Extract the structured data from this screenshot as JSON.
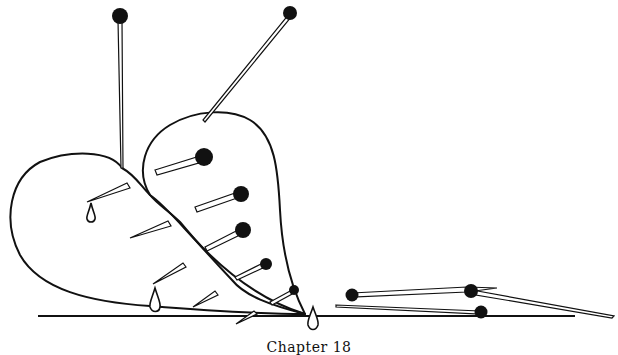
{
  "illustration": {
    "subject": "Two pin-pierced hearts resting on the ground with loose pins beside them",
    "line_color": "#111111",
    "background_color": "#ffffff"
  },
  "caption": {
    "text": "Chapter 18"
  }
}
